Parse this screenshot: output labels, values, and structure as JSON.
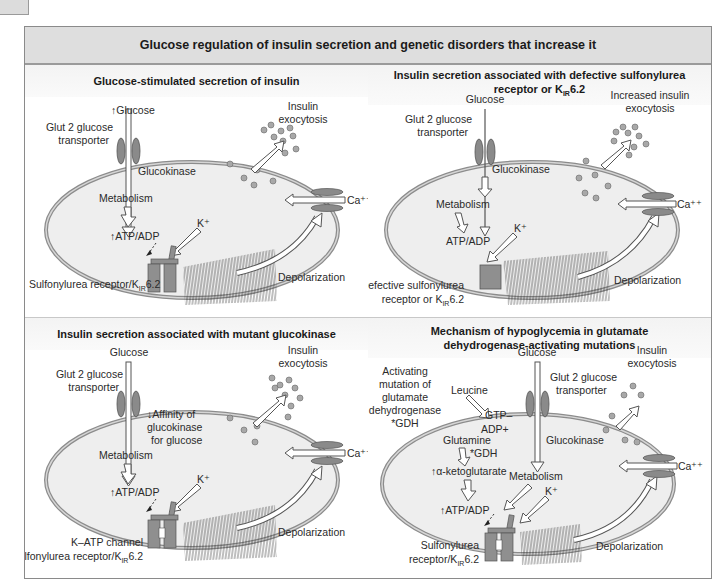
{
  "figure": {
    "title": "Glucose regulation of insulin secretion and genetic disorders that increase it",
    "colors": {
      "title_bar": "#dedede",
      "panel_header": "#f5f5f5",
      "cell_fill": "#eeeeee",
      "membrane": "#8c8c8c",
      "transporter": "#8a8a8a",
      "channel": "#8f8f8f",
      "granule": "#a8a8a8",
      "arrow_fill": "#ffffff",
      "arrow_stroke": "#444444"
    }
  },
  "panels": [
    {
      "id": "glucose-stimulated",
      "title": "Glucose-stimulated secretion of insulin",
      "labels": {
        "glucose": "↑Glucose",
        "transporter_1": "Glut 2 glucose",
        "transporter_2": "transporter",
        "enzyme": "Glucokinase",
        "metabolism": "Metabolism",
        "atp": "↑ATP/ADP",
        "k": "K⁺",
        "exocytosis_1": "Insulin",
        "exocytosis_2": "exocytosis",
        "calcium": "Ca⁺⁺",
        "depolarization": "Depolarization",
        "channel_1": "Sulfonylurea receptor/K",
        "channel_sub": "IR",
        "channel_2": "6.2"
      }
    },
    {
      "id": "defective-sur",
      "title_1": "Insulin secretion associated with defective sulfonylurea",
      "title_2": "receptor or K",
      "title_sub": "IR",
      "title_3": "6.2",
      "labels": {
        "glucose": "Glucose",
        "transporter_1": "Glut 2 glucose",
        "transporter_2": "transporter",
        "enzyme": "Glucokinase",
        "metabolism": "Metabolism",
        "atp": "ATP/ADP",
        "k": "K⁺",
        "exocytosis_1": "Increased insulin",
        "exocytosis_2": "exocytosis",
        "calcium": "Ca⁺⁺",
        "depolarization": "Depolarization",
        "channel_1": "Defective sulfonylurea",
        "channel_2a": "receptor or K",
        "channel_sub": "IR",
        "channel_2b": "6.2"
      }
    },
    {
      "id": "mutant-glucokinase",
      "title": "Insulin secretion associated with mutant glucokinase",
      "labels": {
        "glucose": "Glucose",
        "transporter_1": "Glut 2 glucose",
        "transporter_2": "transporter",
        "enzyme_1": "↓Affinity of",
        "enzyme_2": "glucokinase",
        "enzyme_3": "for glucose",
        "metabolism": "Metabolism",
        "atp": "↑ATP/ADP",
        "k": "K⁺",
        "exocytosis_1": "Insulin",
        "exocytosis_2": "exocytosis",
        "calcium": "Ca⁺⁺",
        "depolarization": "Depolarization",
        "channel_0": "K–ATP channel",
        "channel_1": "Sulfonylurea receptor/K",
        "channel_sub": "IR",
        "channel_2": "6.2"
      }
    },
    {
      "id": "gdh-activating",
      "title_1": "Mechanism of hypoglycemia in glutamate",
      "title_2": "dehydrogenase-activating mutations",
      "labels": {
        "mutation_1": "Activating",
        "mutation_2": "mutation of",
        "mutation_3": "glutamate",
        "mutation_4": "dehydrogenase",
        "mutation_5": "*GDH",
        "leucine": "Leucine",
        "gtp": "GTP–",
        "adp": "ADP+",
        "glutamine": "Glutamine",
        "gdh": "*GDH",
        "akg": "↑α-ketoglutarate",
        "glucose": "Glucose",
        "transporter_1": "Glut 2 glucose",
        "transporter_2": "transporter",
        "enzyme": "Glucokinase",
        "metabolism": "Metabolism",
        "atp": "↑ATP/ADP",
        "k": "K⁺",
        "exocytosis_1": "Insulin",
        "exocytosis_2": "exocytosis",
        "calcium": "Ca⁺⁺",
        "depolarization": "Depolarization",
        "channel_1": "Sulfonylurea",
        "channel_2a": "receptor/K",
        "channel_sub": "IR",
        "channel_2b": "6.2"
      }
    }
  ]
}
